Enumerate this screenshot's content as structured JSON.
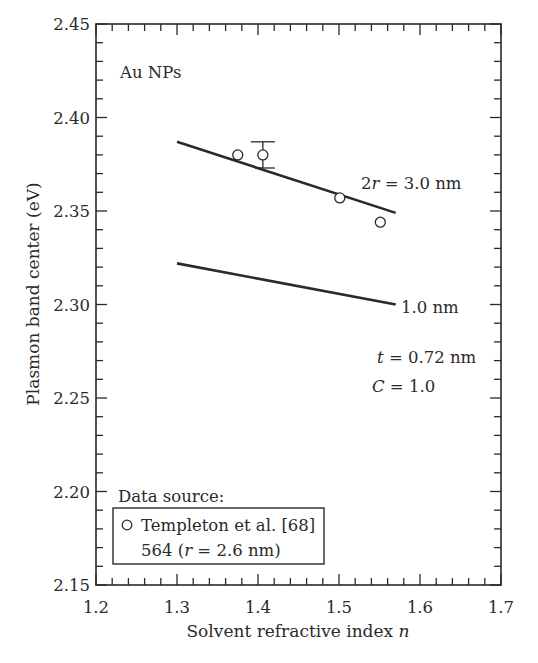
{
  "chart_data": {
    "type": "line",
    "title": "",
    "panel_label": "Au NPs",
    "xlabel": "Solvent refractive index n",
    "xlabel_main": "Solvent refractive index ",
    "xlabel_var": "n",
    "ylabel": "Plasmon band center (eV)",
    "xlim": [
      1.2,
      1.7
    ],
    "ylim": [
      2.15,
      2.45
    ],
    "x_ticks": [
      "1.2",
      "1.3",
      "1.4",
      "1.5",
      "1.6",
      "1.7"
    ],
    "y_ticks": [
      "2.15",
      "2.20",
      "2.25",
      "2.30",
      "2.35",
      "2.40",
      "2.45"
    ],
    "x_minor_step": 0.02,
    "y_minor_step": 0.01,
    "grid": false,
    "series": [
      {
        "name": "2r = 3.0 nm",
        "kind": "line",
        "x": [
          1.3,
          1.57
        ],
        "y": [
          2.387,
          2.349
        ]
      },
      {
        "name": "1.0 nm",
        "kind": "line",
        "x": [
          1.3,
          1.57
        ],
        "y": [
          2.322,
          2.3
        ]
      },
      {
        "name": "Templeton et al. [68] 564 (r = 2.6 nm)",
        "kind": "scatter",
        "marker": "open-circle",
        "x": [
          1.375,
          1.406,
          1.501,
          1.551
        ],
        "y": [
          2.38,
          2.38,
          2.357,
          2.344
        ],
        "error_bars": [
          null,
          [
            2.373,
            2.387
          ],
          null,
          null
        ]
      }
    ],
    "annotations": {
      "line_3nm_label": {
        "prefix": "2",
        "var": "r",
        "suffix": " = 3.0 nm"
      },
      "line_1nm_label": "1.0 nm",
      "param_t": {
        "var": "t",
        "text": " = 0.72 nm"
      },
      "param_C": {
        "var": "C",
        "text": " = 1.0"
      }
    },
    "legend": {
      "heading": "Data source:",
      "entry_line1": "Templeton et al. [68]",
      "entry_line2_prefix": "564 (",
      "entry_line2_var": "r",
      "entry_line2_suffix": " = 2.6 nm)",
      "position": "lower-left"
    },
    "colors": {
      "ink": "#2a2a2a",
      "background": "#ffffff"
    }
  }
}
